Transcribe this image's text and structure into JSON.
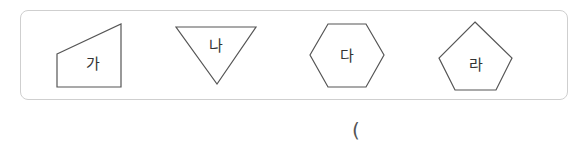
{
  "shapes": [
    {
      "id": "ga",
      "label": "가",
      "type": "trapezoid-quadrilateral"
    },
    {
      "id": "na",
      "label": "나",
      "type": "triangle"
    },
    {
      "id": "da",
      "label": "다",
      "type": "hexagon"
    },
    {
      "id": "ra",
      "label": "라",
      "type": "pentagon"
    }
  ],
  "answer": {
    "open_paren": "("
  },
  "colors": {
    "stroke": "#555555",
    "frame": "#cfcfcf"
  }
}
